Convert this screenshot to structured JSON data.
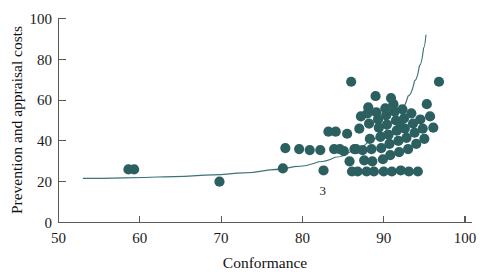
{
  "chart_data": {
    "type": "scatter",
    "title": "",
    "xlabel": "Conformance",
    "ylabel": "Prevention and appraisal costs",
    "xlim": [
      50,
      100
    ],
    "ylim": [
      0,
      100
    ],
    "xticks": [
      50,
      60,
      70,
      80,
      90,
      100
    ],
    "yticks": [
      0,
      20,
      40,
      60,
      80,
      100
    ],
    "xtick_labels": [
      "50",
      "60",
      "70",
      "80",
      "90",
      "100"
    ],
    "ytick_labels": [
      "0",
      "20",
      "40",
      "60",
      "80",
      "100"
    ],
    "grid": false,
    "legend": "none",
    "marker_color": "#2c5f60",
    "marker_size": 8,
    "curve_color": "#3c7474",
    "annotations": [
      {
        "text": "3",
        "x": 82.5,
        "y": 15.5
      }
    ],
    "series": [
      {
        "name": "Prevention and appraisal costs vs Conformance",
        "points": [
          [
            58.6,
            26.0
          ],
          [
            59.3,
            26.0
          ],
          [
            69.8,
            20.0
          ],
          [
            77.6,
            26.5
          ],
          [
            77.9,
            36.5
          ],
          [
            79.6,
            36.0
          ],
          [
            80.9,
            35.5
          ],
          [
            82.2,
            35.5
          ],
          [
            82.6,
            25.5
          ],
          [
            83.9,
            36.0
          ],
          [
            84.6,
            36.0
          ],
          [
            85.1,
            35.0
          ],
          [
            85.5,
            43.5
          ],
          [
            85.8,
            30.0
          ],
          [
            86.0,
            69.0
          ],
          [
            86.1,
            25.0
          ],
          [
            86.4,
            36.0
          ],
          [
            86.6,
            36.0
          ],
          [
            86.8,
            25.0
          ],
          [
            87.0,
            46.0
          ],
          [
            87.2,
            52.0
          ],
          [
            87.4,
            35.5
          ],
          [
            87.6,
            30.5
          ],
          [
            87.9,
            25.0
          ],
          [
            88.0,
            53.5
          ],
          [
            88.2,
            48.5
          ],
          [
            88.3,
            41.0
          ],
          [
            88.5,
            36.0
          ],
          [
            88.6,
            30.0
          ],
          [
            88.8,
            25.0
          ],
          [
            89.0,
            62.0
          ],
          [
            89.1,
            54.0
          ],
          [
            89.3,
            50.5
          ],
          [
            89.4,
            46.5
          ],
          [
            89.6,
            42.0
          ],
          [
            89.7,
            36.5
          ],
          [
            89.9,
            31.0
          ],
          [
            90.0,
            25.0
          ],
          [
            90.2,
            56.0
          ],
          [
            90.3,
            52.5
          ],
          [
            90.4,
            48.0
          ],
          [
            90.6,
            43.0
          ],
          [
            90.7,
            38.5
          ],
          [
            90.8,
            33.0
          ],
          [
            91.0,
            25.0
          ],
          [
            91.2,
            58.0
          ],
          [
            91.3,
            54.5
          ],
          [
            91.5,
            50.0
          ],
          [
            91.6,
            45.0
          ],
          [
            91.8,
            40.0
          ],
          [
            91.9,
            34.5
          ],
          [
            92.1,
            25.5
          ],
          [
            92.3,
            55.5
          ],
          [
            92.5,
            51.0
          ],
          [
            92.6,
            46.0
          ],
          [
            92.8,
            41.5
          ],
          [
            93.0,
            36.0
          ],
          [
            93.1,
            25.0
          ],
          [
            93.4,
            53.5
          ],
          [
            93.6,
            48.5
          ],
          [
            93.8,
            44.0
          ],
          [
            94.0,
            38.5
          ],
          [
            94.2,
            25.0
          ],
          [
            94.5,
            50.5
          ],
          [
            94.8,
            46.0
          ],
          [
            95.0,
            41.0
          ],
          [
            95.3,
            58.0
          ],
          [
            95.7,
            52.0
          ],
          [
            96.1,
            46.5
          ],
          [
            96.8,
            69.0
          ],
          [
            83.2,
            44.5
          ],
          [
            84.1,
            44.5
          ],
          [
            88.1,
            56.5
          ],
          [
            90.9,
            61.0
          ],
          [
            92.0,
            49.0
          ]
        ]
      }
    ],
    "fit_curve": {
      "name": "fitted exponential trend",
      "points": [
        [
          53.0,
          21.6
        ],
        [
          58.0,
          21.9
        ],
        [
          63.0,
          22.4
        ],
        [
          68.0,
          23.2
        ],
        [
          72.0,
          24.2
        ],
        [
          76.0,
          25.8
        ],
        [
          79.0,
          27.4
        ],
        [
          82.0,
          29.8
        ],
        [
          84.0,
          32.0
        ],
        [
          86.0,
          35.0
        ],
        [
          88.0,
          39.2
        ],
        [
          89.5,
          43.5
        ],
        [
          91.0,
          49.5
        ],
        [
          92.0,
          55.0
        ],
        [
          93.0,
          62.0
        ],
        [
          93.8,
          69.5
        ],
        [
          94.4,
          77.0
        ],
        [
          94.9,
          85.5
        ],
        [
          95.2,
          92.0
        ]
      ]
    }
  }
}
